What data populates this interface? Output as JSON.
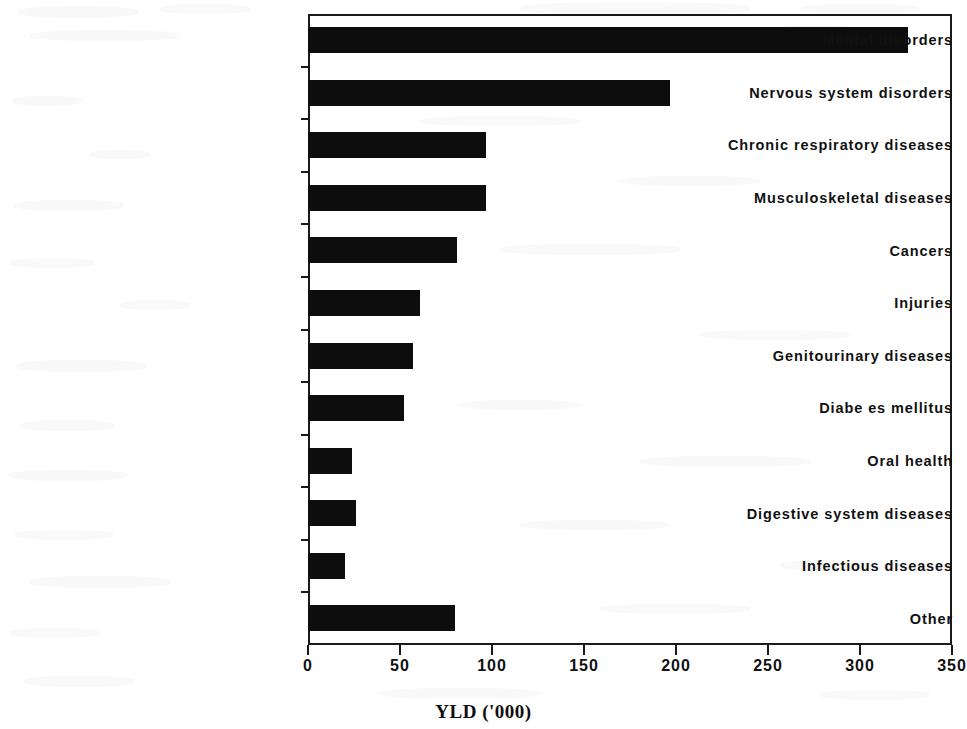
{
  "chart_data": {
    "type": "bar",
    "orientation": "horizontal",
    "title": "",
    "xlabel": "YLD ('000)",
    "ylabel": "",
    "xlim": [
      0,
      350
    ],
    "xticks": [
      0,
      50,
      100,
      150,
      200,
      250,
      300,
      350
    ],
    "grid": false,
    "legend": null,
    "bar_color": "#0d0d0d",
    "axis_color": "#1a1a1a",
    "categories": [
      "Mental disorders",
      "Nervous system disorders",
      "Chronic respiratory diseases",
      "Musculoskeletal diseases",
      "Cancers",
      "Injuries",
      "Genitourinary diseases",
      "Diabe es mellitus",
      "Oral health",
      "Digestive system diseases",
      "Infectious diseases",
      "Other"
    ],
    "values": [
      326,
      197,
      97,
      97,
      81,
      61,
      57,
      52,
      24,
      26,
      20,
      80
    ]
  },
  "background_artifacts": {
    "ghost_text_top": "scanned bleed-through",
    "note": "faint reverse-side print visible as light grey smudges"
  }
}
